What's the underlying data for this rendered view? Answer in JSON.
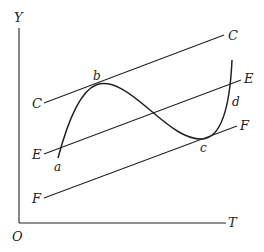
{
  "diagram": {
    "axes": {
      "y_label": "Y",
      "x_label": "T",
      "origin_label": "O"
    },
    "parallel_lines": [
      {
        "name": "C",
        "left_label": "C",
        "right_label": "C"
      },
      {
        "name": "E",
        "left_label": "E",
        "right_label": "E"
      },
      {
        "name": "F",
        "left_label": "F",
        "right_label": "F"
      }
    ],
    "curve_points": [
      {
        "label": "a",
        "description": "curve start, below line E"
      },
      {
        "label": "b",
        "description": "local maximum tangent to line C"
      },
      {
        "label": "c",
        "description": "local minimum tangent to line F"
      },
      {
        "label": "d",
        "description": "rising branch crossing line E"
      }
    ]
  }
}
